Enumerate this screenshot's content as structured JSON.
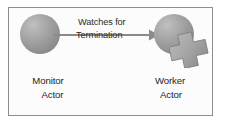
{
  "diagram": {
    "type": "actor-supervision-diagram",
    "frame": {
      "border_color": "#8e8e8e",
      "background_color": "#fcfcfc"
    },
    "palette": {
      "node_fill_light": "#c0c0c0",
      "node_fill_mid": "#9b9b9b",
      "node_fill_dark": "#7e7e7e",
      "connector": "#8a8a8a",
      "text": "#252525"
    },
    "nodes": [
      {
        "id": "monitor",
        "shape": "sphere",
        "icon_name": "actor-sphere-icon",
        "caption_lines": [
          "Monitor",
          "Actor"
        ]
      },
      {
        "id": "worker",
        "shape": "sphere-with-puzzle-piece",
        "icon_name": "actor-sphere-icon",
        "badge_icon_name": "puzzle-cross-icon",
        "caption_lines": [
          "Worker",
          "Actor"
        ]
      }
    ],
    "edges": [
      {
        "id": "watches-for-termination",
        "from": "monitor",
        "to": "worker",
        "direction": "right",
        "arrowhead": true,
        "label_lines": [
          "Watches for",
          "Termination"
        ]
      }
    ]
  }
}
